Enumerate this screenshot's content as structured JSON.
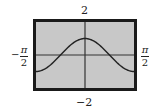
{
  "chart_data": {
    "type": "line",
    "title": "",
    "function": "y = cos(2x)",
    "xlabel": "",
    "ylabel": "",
    "xlim": [
      "-π/2",
      "π/2"
    ],
    "ylim": [
      -2,
      2
    ],
    "tick_labels": {
      "ymax": "2",
      "ymin": "−2",
      "xmin_sign": "−",
      "xmin_num": "π",
      "xmin_den": "2",
      "xmax_num": "π",
      "xmax_den": "2"
    },
    "series": [
      {
        "name": "curve",
        "x": [
          -1.571,
          -1.178,
          -0.785,
          -0.393,
          0,
          0.393,
          0.785,
          1.178,
          1.571
        ],
        "values": [
          -1,
          -0.707,
          0,
          0.707,
          1,
          0.707,
          0,
          -0.707,
          -1
        ]
      }
    ],
    "grid": false,
    "legend": "none",
    "colors": {
      "background": "#c8c8c8",
      "frame": "#1a1a1a",
      "curve": "#222222",
      "axes": "#333333"
    }
  }
}
